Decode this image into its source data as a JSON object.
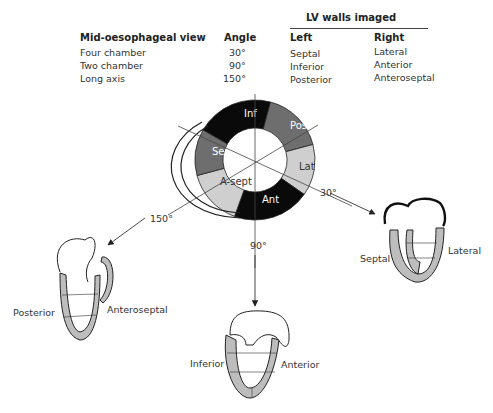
{
  "table": {
    "group_header": "LV walls imaged",
    "columns": [
      "Mid-oesophageal view",
      "Angle",
      "Left",
      "Right"
    ],
    "rows": [
      {
        "view": "Four chamber",
        "angle": "30°",
        "left": "Septal",
        "right": "Lateral"
      },
      {
        "view": "Two chamber",
        "angle": "90°",
        "left": "Inferior",
        "right": "Anterior"
      },
      {
        "view": "Long axis",
        "angle": "150°",
        "left": "Posterior",
        "right": "Anteroseptal"
      }
    ]
  },
  "short_axis": {
    "segments": [
      {
        "label": "Inf",
        "color": "#0a0a0a",
        "text_color": "#ffffff"
      },
      {
        "label": "Post",
        "color": "#6e6e6e",
        "text_color": "#ffffff"
      },
      {
        "label": "Lat",
        "color": "#cfcfcf",
        "text_color": "#333333"
      },
      {
        "label": "Ant",
        "color": "#0a0a0a",
        "text_color": "#ffffff"
      },
      {
        "label": "A-sept",
        "color": "#cfcfcf",
        "text_color": "#333333"
      },
      {
        "label": "Sept",
        "color": "#6e6e6e",
        "text_color": "#ffffff"
      }
    ],
    "angle_labels": {
      "a30": "30°",
      "a90": "90°",
      "a150": "150°"
    }
  },
  "views": {
    "four_chamber": {
      "left": "Septal",
      "right": "Lateral"
    },
    "two_chamber": {
      "left": "Inferior",
      "right": "Anterior"
    },
    "long_axis": {
      "left": "Posterior",
      "right": "Anteroseptal"
    }
  }
}
